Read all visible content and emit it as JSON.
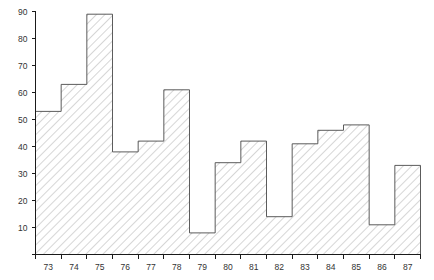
{
  "chart_data": {
    "type": "bar",
    "title": "",
    "subtitle": "",
    "xlabel": "",
    "ylabel": "",
    "categories": [
      "73",
      "74",
      "75",
      "76",
      "77",
      "78",
      "79",
      "80",
      "81",
      "82",
      "83",
      "84",
      "85",
      "86",
      "87"
    ],
    "values": [
      53,
      63,
      89,
      38,
      42,
      61,
      8,
      34,
      42,
      14,
      41,
      46,
      48,
      11,
      33
    ],
    "series": [
      {
        "name": "frequency",
        "values": [
          53,
          63,
          89,
          38,
          42,
          61,
          8,
          34,
          42,
          14,
          41,
          46,
          48,
          11,
          33
        ]
      }
    ],
    "ylim": [
      0,
      90
    ],
    "xlim": [
      73,
      88
    ],
    "y_ticks": [
      0,
      10,
      20,
      30,
      40,
      50,
      60,
      70,
      80,
      90
    ],
    "y_tick_labels": [
      "",
      "10",
      "20",
      "30",
      "40",
      "50",
      "60",
      "70",
      "80",
      "90"
    ],
    "x_ticks": [
      "73",
      "74",
      "75",
      "76",
      "77",
      "78",
      "79",
      "80",
      "81",
      "82",
      "83",
      "84",
      "85",
      "86",
      "87"
    ],
    "grid": false,
    "legend": false,
    "legend_position": "none",
    "bar_style": {
      "fill_pattern": "diagonal-hatch-45",
      "fill_color": "#ffffff",
      "hatch_color": "#b4b4b4",
      "edge_color": "#4a4a4a"
    },
    "axis_color": "#1a1a1a",
    "background": "#ffffff",
    "annotations": []
  }
}
